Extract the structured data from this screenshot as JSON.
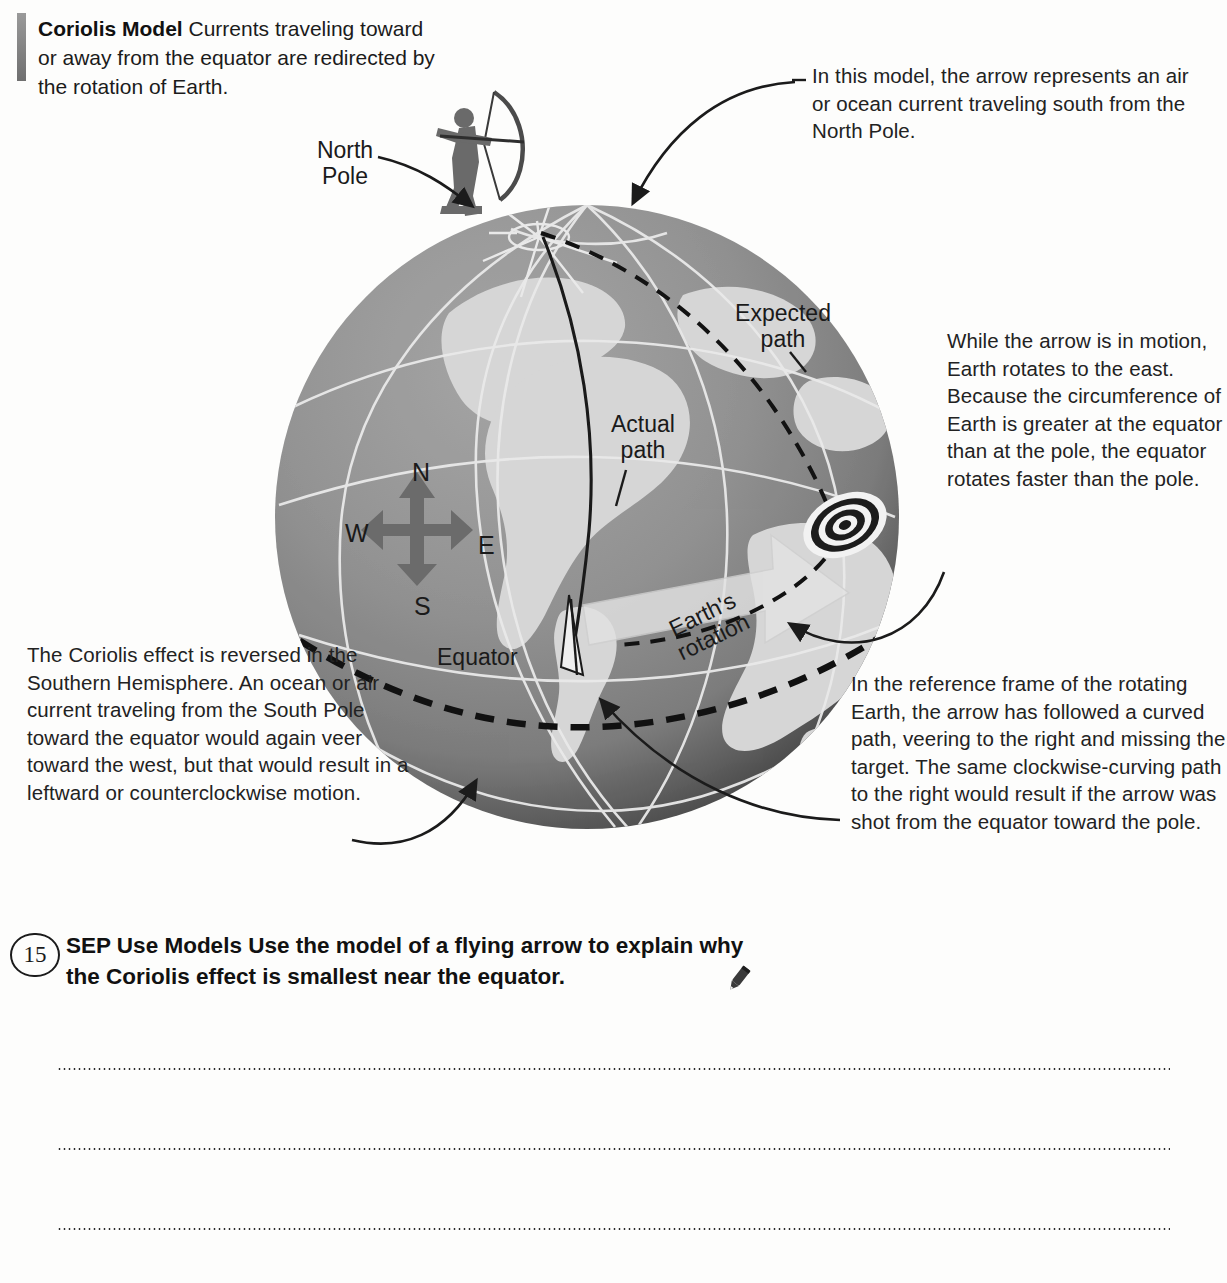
{
  "header": {
    "title": "Coriolis Model",
    "body": " Currents traveling toward or away from the equator are redirected by the rotation of Earth."
  },
  "callouts": {
    "top_right": "In this model, the arrow represents an air or ocean current traveling south from the North Pole.",
    "right_mid": "While the arrow is in motion, Earth rotates to the east. Because the circumference of Earth is greater at the equator than at the pole, the equator rotates faster than the pole.",
    "bottom_right": "In the reference frame of the rotating Earth, the arrow has followed a curved path, veering to the right and missing the target. The same clockwise-curving path to the right would result if the arrow was shot from the equator toward the pole.",
    "bottom_left": "The Coriolis effect is reversed in the Southern Hemisphere. An ocean or air current traveling from the South Pole toward the equator would again veer toward the west, but that would result in a leftward or counterclockwise motion."
  },
  "globe_labels": {
    "north_pole": "North Pole",
    "expected_path": "Expected path",
    "actual_path": "Actual path",
    "equator": "Equator",
    "earths_rotation": "Earth's rotation",
    "compass_n": "N",
    "compass_s": "S",
    "compass_w": "W",
    "compass_e": "E"
  },
  "question": {
    "number": "15",
    "label": "SEP Use Models",
    "prompt": " Use the model of a flying arrow to explain why the Coriolis effect is smallest near the equator.",
    "icon": "pencil-icon"
  },
  "answer_lines": [
    "",
    "",
    ""
  ],
  "colors": {
    "ocean": "#8c8c8c",
    "land": "#d2d2d2",
    "ink": "#1b1b1b",
    "page": "#fdfdfc",
    "accent_bar": "#7d7d7d"
  }
}
